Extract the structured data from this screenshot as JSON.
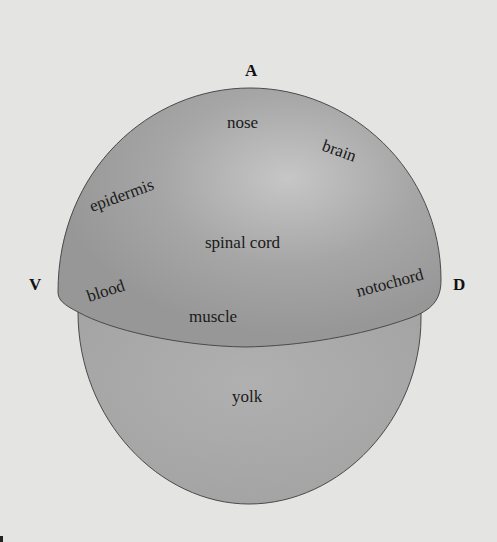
{
  "figure": {
    "type": "embryo fate map diagram",
    "axes": {
      "anterior": "A",
      "ventral": "V",
      "dorsal": "D"
    },
    "regions": {
      "animal_cap": [
        "nose",
        "brain",
        "epidermis",
        "spinal cord",
        "blood",
        "notochord",
        "muscle"
      ],
      "vegetal": [
        "yolk"
      ]
    },
    "labels": {
      "nose": "nose",
      "brain": "brain",
      "epidermis": "epidermis",
      "spinal_cord": "spinal cord",
      "blood": "blood",
      "notochord": "notochord",
      "muscle": "muscle",
      "yolk": "yolk"
    },
    "colors": {
      "background": "#e4e4e2",
      "cap": "#9e9e9e",
      "cap_highlight": "#c4c4c4",
      "yolk": "#a9a9a9",
      "outline": "#4a4a4a"
    }
  }
}
